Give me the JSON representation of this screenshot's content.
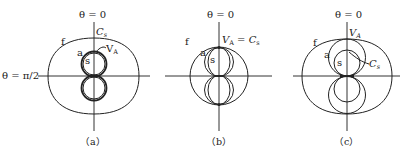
{
  "figure": {
    "panels": [
      {
        "id": "a",
        "caption": "（a）",
        "axis_top_label": "θ = 0",
        "axis_side_label": "θ = π/2",
        "curve_labels": {
          "f": "f",
          "a": "a",
          "s": "s",
          "ca_main": "C",
          "ca_sub": "s",
          "va_main": "V",
          "va_sub": "A"
        }
      },
      {
        "id": "b",
        "caption": "（b）",
        "axis_top_label": "θ = 0",
        "curve_labels": {
          "f": "f",
          "a": "a",
          "s": "s",
          "eq_v_main": "V",
          "eq_v_sub": "A",
          "eq_mid": " = ",
          "eq_c_main": "C",
          "eq_c_sub": "s"
        }
      },
      {
        "id": "c",
        "caption": "（c）",
        "axis_top_label": "θ = 0",
        "curve_labels": {
          "f": "f",
          "a": "a",
          "s": "s",
          "va_main": "V",
          "va_sub": "A",
          "cs_main": "C",
          "cs_sub": "s"
        }
      }
    ]
  }
}
